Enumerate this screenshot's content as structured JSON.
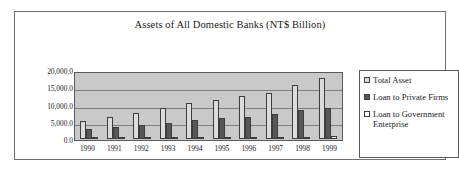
{
  "chart_data": {
    "type": "bar",
    "title": "Assets of All Domestic Banks (NT$ Billion)",
    "xlabel": "",
    "ylabel": "",
    "categories": [
      "1990",
      "1991",
      "1992",
      "1993",
      "1994",
      "1995",
      "1996",
      "1997",
      "1998",
      "1999"
    ],
    "series": [
      {
        "name": "Total Asset",
        "color": "#dcdcdc",
        "values": [
          5500,
          6600,
          7900,
          9300,
          10700,
          11700,
          12800,
          13800,
          16200,
          18300
        ]
      },
      {
        "name": "Loan to Private Firms",
        "color": "#575757",
        "values": [
          2900,
          3500,
          4300,
          4900,
          5700,
          6200,
          6600,
          7600,
          8600,
          9400
        ]
      },
      {
        "name": "Loan to Government Enterprise",
        "color": "#ffffff",
        "values": [
          500,
          500,
          500,
          600,
          600,
          600,
          600,
          700,
          700,
          800
        ]
      }
    ],
    "ylim": [
      0,
      20000
    ],
    "ytick_values": [
      20000,
      15000,
      10000,
      5000,
      0
    ],
    "ytick_labels": [
      "20,000.0",
      "15,000.0",
      "10,000.0",
      "5,000.0",
      "0.0"
    ],
    "grid": true,
    "legend_position": "right",
    "plot_background": "#c9c9c9"
  },
  "legend": {
    "entries": [
      {
        "label": "Total Asset",
        "swatch": "series-total"
      },
      {
        "label": "Loan to Private Firms",
        "swatch": "series-private"
      },
      {
        "label": "Loan to Government Enterprise",
        "swatch": "series-govt"
      }
    ]
  }
}
